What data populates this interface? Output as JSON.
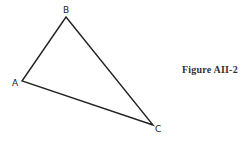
{
  "figure": {
    "caption": "Figure AII-2",
    "vertices": [
      {
        "label": "A",
        "x": 22,
        "y": 81,
        "lx": 12,
        "ly": 86
      },
      {
        "label": "B",
        "x": 66,
        "y": 17,
        "lx": 63,
        "ly": 13
      },
      {
        "label": "C",
        "x": 153,
        "y": 125,
        "lx": 155,
        "ly": 132
      }
    ],
    "stroke_color": "#222222"
  }
}
